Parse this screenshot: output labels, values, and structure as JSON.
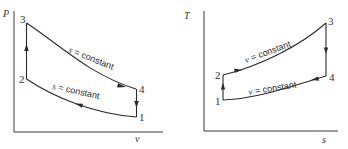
{
  "diagrams": [
    {
      "name": "pv-diagram",
      "y_axis_label": "P",
      "x_axis_label": "v",
      "points": [
        {
          "id": "1",
          "label": "1"
        },
        {
          "id": "2",
          "label": "2"
        },
        {
          "id": "3",
          "label": "3"
        },
        {
          "id": "4",
          "label": "4"
        }
      ],
      "annotations": {
        "upper_var": "s",
        "upper_rest": " = constant",
        "lower_var": "s",
        "lower_rest": " = constant"
      }
    },
    {
      "name": "ts-diagram",
      "y_axis_label": "T",
      "x_axis_label": "s",
      "points": [
        {
          "id": "1",
          "label": "1"
        },
        {
          "id": "2",
          "label": "2"
        },
        {
          "id": "3",
          "label": "3"
        },
        {
          "id": "4",
          "label": "4"
        }
      ],
      "annotations": {
        "upper_var": "v",
        "upper_rest": " = constant",
        "lower_var": "v",
        "lower_rest": " = constant"
      }
    }
  ]
}
